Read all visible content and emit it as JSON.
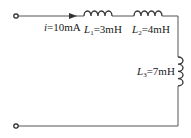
{
  "diagram": {
    "type": "circuit",
    "current": {
      "symbol": "i",
      "value": "=10mA"
    },
    "inductors": [
      {
        "symbol": "L",
        "sub": "1",
        "value": "=3mH"
      },
      {
        "symbol": "L",
        "sub": "2",
        "value": "=4mH"
      },
      {
        "symbol": "L",
        "sub": "3",
        "value": "=7mH"
      }
    ],
    "colors": {
      "wire": "#555555",
      "text": "#1a1a1a"
    }
  }
}
